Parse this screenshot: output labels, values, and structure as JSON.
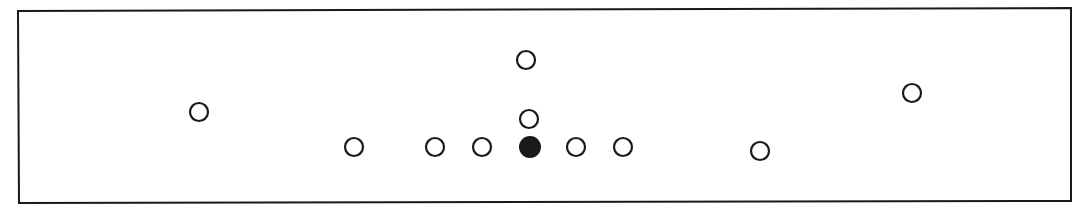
{
  "diagram": {
    "type": "player-formation",
    "background": "#ffffff",
    "stroke_color": "#1a1a1a",
    "frame": {
      "corners": [
        [
          18,
          11
        ],
        [
          1071,
          8
        ],
        [
          1071,
          201
        ],
        [
          19,
          203
        ]
      ],
      "stroke_width": 2
    },
    "markers": [
      {
        "id": "left-wing",
        "x": 199,
        "y": 112,
        "r": 10,
        "filled": false
      },
      {
        "id": "left-end",
        "x": 354,
        "y": 147,
        "r": 10,
        "filled": false
      },
      {
        "id": "left-tackle",
        "x": 435,
        "y": 147,
        "r": 10,
        "filled": false
      },
      {
        "id": "left-guard",
        "x": 482,
        "y": 147,
        "r": 10,
        "filled": false
      },
      {
        "id": "center",
        "x": 530,
        "y": 147,
        "r": 11,
        "filled": true
      },
      {
        "id": "right-guard",
        "x": 576,
        "y": 147,
        "r": 10,
        "filled": false
      },
      {
        "id": "right-tackle",
        "x": 623,
        "y": 147,
        "r": 10,
        "filled": false
      },
      {
        "id": "quarterback",
        "x": 529,
        "y": 119,
        "r": 10,
        "filled": false
      },
      {
        "id": "deep-back",
        "x": 526,
        "y": 60,
        "r": 10,
        "filled": false
      },
      {
        "id": "right-end",
        "x": 760,
        "y": 151,
        "r": 10,
        "filled": false
      },
      {
        "id": "right-wing",
        "x": 912,
        "y": 93,
        "r": 10,
        "filled": false
      }
    ],
    "counts": {
      "open_markers": 10,
      "filled_markers": 1
    }
  }
}
